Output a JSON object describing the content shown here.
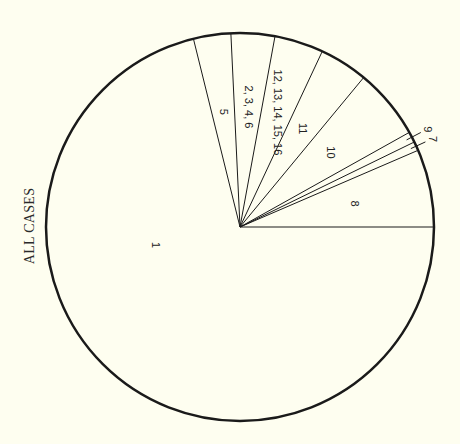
{
  "chart_data": {
    "type": "pie",
    "title": "ALL CASES",
    "title_orientation": "vertical, left side",
    "start_angle_deg": 0,
    "direction": "counterclockwise",
    "slices": [
      {
        "label": "8",
        "degrees": 23.3,
        "percent": 6.5
      },
      {
        "label": "7",
        "degrees": 2.7,
        "percent": 0.75
      },
      {
        "label": "9",
        "degrees": 3.2,
        "percent": 0.9
      },
      {
        "label": "10",
        "degrees": 21.2,
        "percent": 5.9
      },
      {
        "label": "11",
        "degrees": 14.5,
        "percent": 4.0
      },
      {
        "label": "12, 13, 14, 15, 16",
        "degrees": 14.7,
        "percent": 4.1
      },
      {
        "label": "2, 3, 4, 6",
        "degrees": 13.1,
        "percent": 3.6
      },
      {
        "label": "5",
        "degrees": 11.2,
        "percent": 3.1
      },
      {
        "label": "1",
        "degrees": 256.1,
        "percent": 71.1
      }
    ],
    "labels_rotated": true,
    "legend": false,
    "grid": false
  },
  "colors": {
    "background": "#fefef0",
    "stroke": "#1a1a1a"
  }
}
